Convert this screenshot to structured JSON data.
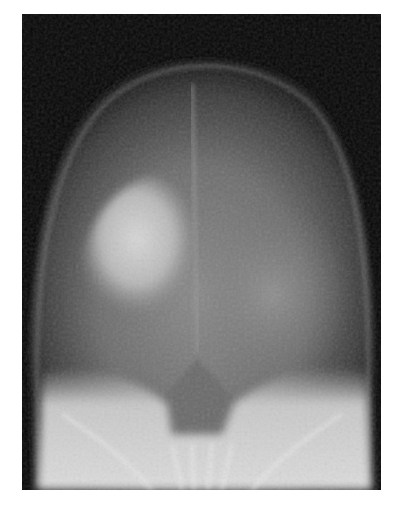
{
  "image": {
    "type": "radiograph",
    "description": "Frontal skull X-ray with a bright, mottled sclerotic region in the upper left hemicranium, midline falx, and dense skull base below",
    "alt_text": "Skull radiograph",
    "colors": {
      "background": "#ffffff",
      "film_dark": "#060606",
      "soft_tissue": "#6a6a6a",
      "bone_bright": "#e8e8e8"
    }
  }
}
